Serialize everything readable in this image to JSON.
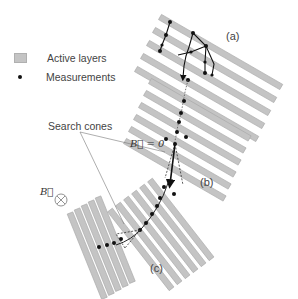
{
  "legend": {
    "items": [
      {
        "label": "Active layers",
        "symbol": "gray-rectangle"
      },
      {
        "label": "Measurements",
        "symbol": "black-dot"
      }
    ]
  },
  "labels": {
    "panel_a": "(a)",
    "panel_b": "(b)",
    "panel_c": "(c)",
    "search_cones": "Search cones",
    "b_zero": "B⃗ = 0",
    "b_field": "B⃗",
    "b_field_symbol": "⊗"
  },
  "colors": {
    "layer_fill": "#c4c4c4",
    "layer_stroke": "#a8a8a8",
    "measurement": "#111111",
    "track": "#111111",
    "text": "#444444"
  }
}
